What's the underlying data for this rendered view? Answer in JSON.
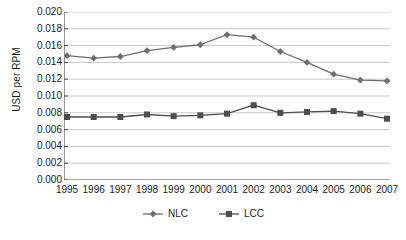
{
  "chart_data": {
    "type": "line",
    "title": "",
    "xlabel": "",
    "ylabel": "USD per RPM",
    "categories": [
      "1995",
      "1996",
      "1997",
      "1998",
      "1999",
      "2000",
      "2001",
      "2002",
      "2003",
      "2004",
      "2005",
      "2006",
      "2007"
    ],
    "ylim": [
      0.0,
      0.02
    ],
    "ytick_labels": [
      "0.020",
      "0.018",
      "0.016",
      "0.014",
      "0.012",
      "0.010",
      "0.008",
      "0.006",
      "0.004",
      "0.002",
      "0.000"
    ],
    "ytick_values": [
      0.02,
      0.018,
      0.016,
      0.014,
      0.012,
      0.01,
      0.008,
      0.006,
      0.004,
      0.002,
      0.0
    ],
    "grid": true,
    "legend_position": "bottom",
    "series": [
      {
        "name": "NLC",
        "marker": "diamond",
        "color": "#6e6e6e",
        "values": [
          0.0148,
          0.0145,
          0.0147,
          0.0154,
          0.0158,
          0.0161,
          0.0173,
          0.017,
          0.0153,
          0.014,
          0.0126,
          0.0119,
          0.0118
        ]
      },
      {
        "name": "LCC",
        "marker": "square",
        "color": "#4d4d4d",
        "values": [
          0.0075,
          0.0075,
          0.0075,
          0.0078,
          0.0076,
          0.0077,
          0.0079,
          0.0089,
          0.008,
          0.0081,
          0.0082,
          0.0079,
          0.0073
        ]
      }
    ]
  },
  "style": {
    "axis_color": "#4d4d4d",
    "grid_color": "#c8c8c8",
    "text_color": "#1a1a1a",
    "background": "#ffffff"
  }
}
